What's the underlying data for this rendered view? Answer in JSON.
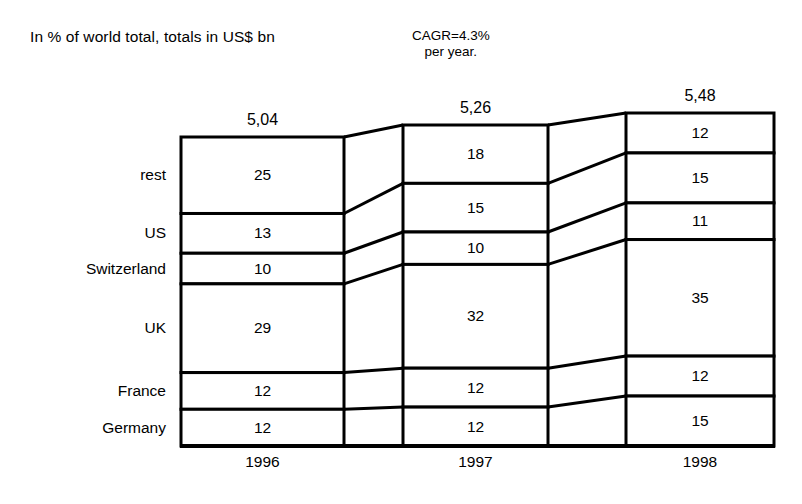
{
  "notes": {
    "units_note": "In % of world total, totals in US$ bn",
    "cagr_line1": "CAGR=4.3%",
    "cagr_line2": "per year."
  },
  "chart_data": {
    "type": "bar",
    "subtype": "stacked-column-with-connector-bands",
    "title": "",
    "subtitle": "In % of world total, totals in US$ bn",
    "annotations": [
      "CAGR=4.3%",
      "per year."
    ],
    "xlabel": "",
    "ylabel": "",
    "categories": [
      "1996",
      "1997",
      "1998"
    ],
    "column_totals": [
      "5,04",
      "5,26",
      "5,48"
    ],
    "column_totals_numeric": [
      5.04,
      5.26,
      5.48
    ],
    "total_units": "US$ bn",
    "value_units": "% of world total",
    "stack_order_top_to_bottom": [
      "rest",
      "US",
      "Switzerland",
      "UK",
      "France",
      "Germany"
    ],
    "series": [
      {
        "name": "rest",
        "values": [
          25,
          18,
          12
        ]
      },
      {
        "name": "US",
        "values": [
          13,
          15,
          15
        ]
      },
      {
        "name": "Switzerland",
        "values": [
          10,
          10,
          11
        ]
      },
      {
        "name": "UK",
        "values": [
          29,
          32,
          35
        ]
      },
      {
        "name": "France",
        "values": [
          12,
          12,
          12
        ]
      },
      {
        "name": "Germany",
        "values": [
          12,
          12,
          15
        ]
      }
    ],
    "grid": false,
    "legend": "row-labels-left",
    "axis_visible": "baseline-only"
  }
}
